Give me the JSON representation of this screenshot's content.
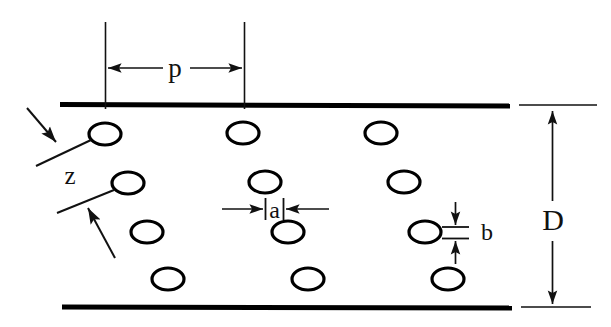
{
  "figure": {
    "type": "technical-cross-section-diagram",
    "background_color": "#ffffff",
    "line_color": "#111111",
    "wall_color": "#000000"
  },
  "labels": {
    "pitch": "p",
    "width": "a",
    "height": "b",
    "duct_height": "D",
    "offset": "z"
  },
  "geometry": {
    "top_wall": {
      "x1": 60,
      "y1": 104,
      "x2": 510,
      "y2": 106,
      "thickness": 5
    },
    "bottom_wall": {
      "x1": 62,
      "y1": 307,
      "x2": 512,
      "y2": 308,
      "thickness": 5
    },
    "top_extension": {
      "x1": 520,
      "y1": 105,
      "x2": 596,
      "y2": 105
    },
    "bottom_extension": {
      "x1": 522,
      "y1": 307,
      "x2": 590,
      "y2": 307
    },
    "pitch_line_left_x": 105,
    "pitch_line_right_x": 244,
    "pitch_line_top_y": 22,
    "pitch_line_bottom_y": 108,
    "pitch_arrow_y": 68,
    "d_dimension_x": 552,
    "d_top_y": 110,
    "d_bottom_y": 304,
    "a_tick_left_x": 265,
    "a_tick_right_x": 283,
    "a_arrow_y": 209,
    "b_tick_y_top": 227,
    "b_tick_y_bottom": 238,
    "b_tick_x": 455,
    "ellipse_rx": 16,
    "ellipse_ry": 11
  },
  "ellipses": [
    {
      "row": 1,
      "cx": 105,
      "cy": 134
    },
    {
      "row": 1,
      "cx": 243,
      "cy": 133
    },
    {
      "row": 1,
      "cx": 381,
      "cy": 133
    },
    {
      "row": 2,
      "cx": 128,
      "cy": 183
    },
    {
      "row": 2,
      "cx": 265,
      "cy": 182
    },
    {
      "row": 2,
      "cx": 404,
      "cy": 182
    },
    {
      "row": 3,
      "cx": 147,
      "cy": 232
    },
    {
      "row": 3,
      "cx": 288,
      "cy": 232
    },
    {
      "row": 3,
      "cx": 425,
      "cy": 232
    },
    {
      "row": 4,
      "cx": 168,
      "cy": 279
    },
    {
      "row": 4,
      "cx": 308,
      "cy": 279
    },
    {
      "row": 4,
      "cx": 448,
      "cy": 279
    }
  ],
  "leaders": [
    {
      "name": "z-upper-leader",
      "x1": 36,
      "y1": 165,
      "x2": 90,
      "y2": 140
    },
    {
      "name": "z-upper-arrow",
      "x1": 27,
      "y1": 109,
      "x2": 57,
      "y2": 143
    },
    {
      "name": "z-lower-leader",
      "x1": 57,
      "y1": 212,
      "x2": 113,
      "y2": 190
    },
    {
      "name": "z-lower-arrow",
      "x1": 114,
      "y1": 257,
      "x2": 87,
      "y2": 207
    }
  ],
  "label_positions": {
    "p": {
      "x": 175,
      "y": 76
    },
    "z": {
      "x": 70,
      "y": 181
    },
    "a": {
      "x": 274,
      "y": 217
    },
    "b": {
      "x": 487,
      "y": 239
    },
    "D": {
      "x": 553,
      "y": 228
    }
  }
}
